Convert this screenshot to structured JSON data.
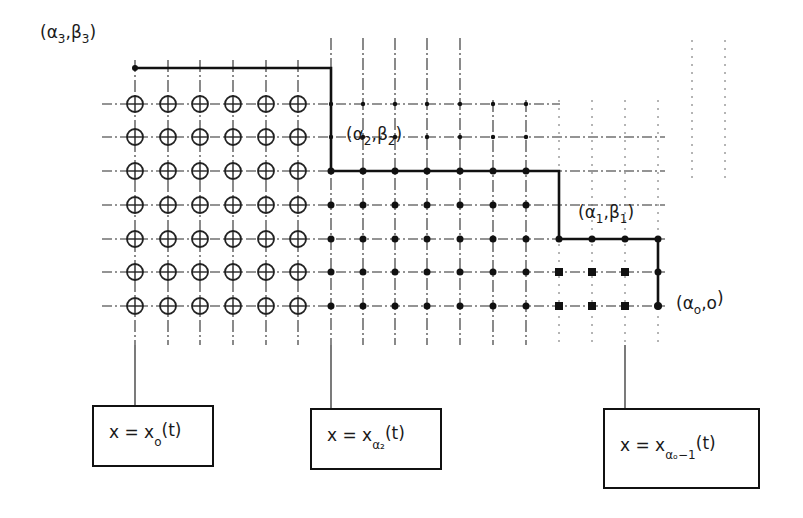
{
  "diagram": {
    "grid": {
      "columns_x": [
        135,
        168,
        200,
        233,
        266,
        298,
        331,
        363,
        395,
        427,
        460,
        493,
        526,
        559,
        592,
        625,
        658
      ],
      "rows_y": [
        104,
        137,
        171,
        205,
        239,
        272,
        306
      ],
      "circle_columns": 6,
      "circle_rows": 7
    },
    "corner_labels": [
      {
        "id": "a3b3",
        "base": "(α",
        "sub1": "3",
        "mid": ",β",
        "sub2": "3",
        "end": ")",
        "x": 40,
        "y": 38
      },
      {
        "id": "a2b2",
        "base": "(α",
        "sub1": "2",
        "mid": ",β",
        "sub2": "2",
        "end": ")",
        "x": 346,
        "y": 140
      },
      {
        "id": "a1b1",
        "base": "(α",
        "sub1": "1",
        "mid": ",β",
        "sub2": "1",
        "end": ")",
        "x": 578,
        "y": 218
      },
      {
        "id": "a0b0",
        "base": "(α",
        "sub1": "o",
        "mid": ",o",
        "sub2": "",
        "end": ")",
        "x": 676,
        "y": 309
      }
    ],
    "equation_boxes": [
      {
        "id": "box-x0",
        "lhs": "x = x",
        "sub": "o",
        "rhs": "(t)",
        "box_x": 93,
        "box_y": 406,
        "box_w": 120,
        "box_h": 60,
        "connector_x": 135
      },
      {
        "id": "box-xa2",
        "lhs": "x = x",
        "sub": "α₂",
        "rhs": "(t)",
        "box_x": 311,
        "box_y": 409,
        "box_w": 130,
        "box_h": 60,
        "connector_x": 331
      },
      {
        "id": "box-xa0-1",
        "lhs": "x = x",
        "sub": "αₒ−1",
        "rhs": "(t)",
        "box_x": 604,
        "box_y": 409,
        "box_w": 155,
        "box_h": 79,
        "connector_x": 625
      }
    ],
    "staircase": {
      "points": [
        [
          135,
          68
        ],
        [
          331,
          68
        ],
        [
          331,
          171
        ],
        [
          559,
          171
        ],
        [
          559,
          239
        ],
        [
          658,
          239
        ],
        [
          658,
          306
        ]
      ]
    },
    "colors": {
      "ink": "#1a1a1a",
      "background": "#ffffff"
    }
  }
}
